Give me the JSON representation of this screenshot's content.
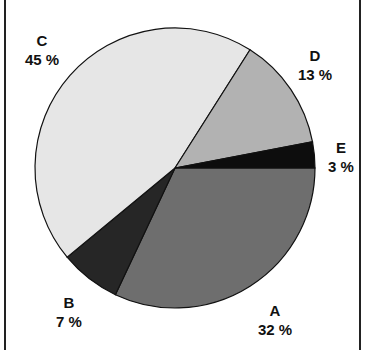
{
  "chart_data": {
    "type": "pie",
    "title": "",
    "start_angle_deg_clockwise_from_east": 0,
    "slices": [
      {
        "label": "A",
        "value": 32,
        "display": "32 %",
        "color": "#6e6e6e"
      },
      {
        "label": "B",
        "value": 7,
        "display": "7 %",
        "color": "#262626"
      },
      {
        "label": "C",
        "value": 45,
        "display": "45 %",
        "color": "#e6e6e6"
      },
      {
        "label": "D",
        "value": 13,
        "display": "13 %",
        "color": "#b2b2b2"
      },
      {
        "label": "E",
        "value": 3,
        "display": "3 %",
        "color": "#0d0d0d"
      }
    ],
    "legend": "none",
    "labels_outside": true
  },
  "labels": {
    "A": {
      "name": "A",
      "pct": "32 %"
    },
    "B": {
      "name": "B",
      "pct": "7 %"
    },
    "C": {
      "name": "C",
      "pct": "45 %"
    },
    "D": {
      "name": "D",
      "pct": "13 %"
    },
    "E": {
      "name": "E",
      "pct": "3 %"
    }
  }
}
